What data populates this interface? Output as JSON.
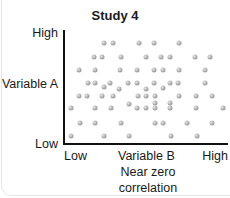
{
  "chart_data": {
    "type": "scatter",
    "title": "Study 4",
    "xlabel": "Variable B",
    "ylabel": "Variable A",
    "x_ticks": [
      "Low",
      "High"
    ],
    "y_ticks": [
      "Low",
      "High"
    ],
    "caption": [
      "Near zero",
      "correlation"
    ],
    "grid": false,
    "legend": null,
    "xlim": [
      0,
      100
    ],
    "ylim": [
      0,
      100
    ],
    "points_px": [
      [
        104,
        43
      ],
      [
        113,
        43
      ],
      [
        139,
        43
      ],
      [
        154,
        43
      ],
      [
        179,
        43
      ],
      [
        94,
        57
      ],
      [
        102,
        57
      ],
      [
        121,
        57
      ],
      [
        146,
        57
      ],
      [
        161,
        57
      ],
      [
        170,
        57
      ],
      [
        195,
        57
      ],
      [
        210,
        57
      ],
      [
        79,
        70
      ],
      [
        95,
        70
      ],
      [
        120,
        70
      ],
      [
        137,
        70
      ],
      [
        154,
        70
      ],
      [
        163,
        70
      ],
      [
        179,
        70
      ],
      [
        205,
        70
      ],
      [
        88,
        83
      ],
      [
        95,
        83
      ],
      [
        104,
        87
      ],
      [
        110,
        83
      ],
      [
        119,
        89
      ],
      [
        128,
        83
      ],
      [
        137,
        83
      ],
      [
        146,
        89
      ],
      [
        154,
        83
      ],
      [
        163,
        88
      ],
      [
        170,
        83
      ],
      [
        178,
        83
      ],
      [
        205,
        83
      ],
      [
        79,
        96
      ],
      [
        87,
        96
      ],
      [
        102,
        96
      ],
      [
        113,
        96
      ],
      [
        138,
        96
      ],
      [
        146,
        96
      ],
      [
        155,
        96
      ],
      [
        179,
        96
      ],
      [
        196,
        96
      ],
      [
        212,
        96
      ],
      [
        71,
        108
      ],
      [
        95,
        108
      ],
      [
        111,
        108
      ],
      [
        129,
        104
      ],
      [
        137,
        108
      ],
      [
        146,
        108
      ],
      [
        155,
        103
      ],
      [
        155,
        108
      ],
      [
        170,
        103
      ],
      [
        170,
        108
      ],
      [
        196,
        108
      ],
      [
        223,
        108
      ],
      [
        80,
        123
      ],
      [
        95,
        123
      ],
      [
        121,
        123
      ],
      [
        155,
        123
      ],
      [
        163,
        123
      ],
      [
        187,
        123
      ],
      [
        212,
        123
      ],
      [
        71,
        136
      ],
      [
        104,
        136
      ],
      [
        129,
        136
      ],
      [
        171,
        136
      ],
      [
        197,
        136
      ]
    ]
  }
}
